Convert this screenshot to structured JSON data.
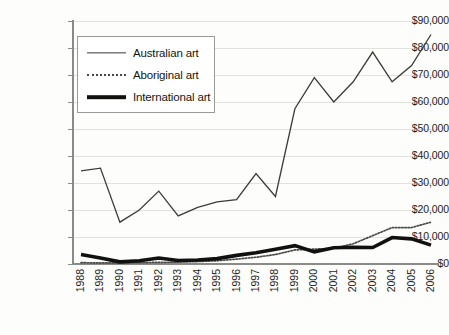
{
  "chart_data": {
    "type": "line",
    "title": "",
    "xlabel": "",
    "ylabel": "",
    "ylim": [
      0,
      90000
    ],
    "ytick_step": 10000,
    "grid": true,
    "legend_position": "top-left-inside",
    "ytick_labels": [
      "$90,000",
      "$80,000",
      "$70,000",
      "$60,000",
      "$50,000",
      "$40,000",
      "$30,000",
      "$20,000",
      "$10,000",
      "$0"
    ],
    "ytick_values": [
      90000,
      80000,
      70000,
      60000,
      50000,
      40000,
      30000,
      20000,
      10000,
      0
    ],
    "categories": [
      "1988",
      "1989",
      "1990",
      "1991",
      "1992",
      "1993",
      "1994",
      "1995",
      "1996",
      "1997",
      "1998",
      "1999",
      "2000",
      "2001",
      "2002",
      "2003",
      "2004",
      "2005",
      "2006"
    ],
    "x": [
      1988,
      1989,
      1990,
      1991,
      1992,
      1993,
      1994,
      1995,
      1996,
      1997,
      1998,
      1999,
      2000,
      2001,
      2002,
      2003,
      2004,
      2005,
      2006
    ],
    "series": [
      {
        "name": "Australian art",
        "style": "solid-thin",
        "color": "#3b3b39",
        "values": [
          34500,
          35500,
          15500,
          20000,
          27000,
          17800,
          21000,
          23000,
          23800,
          33500,
          25000,
          57500,
          69000,
          60000,
          67500,
          78500,
          67500,
          73500,
          85000
        ]
      },
      {
        "name": "Aboriginal art",
        "style": "dotted",
        "color": "#4a4a48",
        "values": [
          500,
          400,
          400,
          500,
          600,
          700,
          900,
          1200,
          1800,
          2500,
          3500,
          5200,
          5500,
          5800,
          7500,
          10500,
          13500,
          13500,
          15500
        ]
      },
      {
        "name": "International art",
        "style": "solid-thick",
        "color": "#111110",
        "values": [
          3500,
          2200,
          800,
          1200,
          2200,
          1300,
          1500,
          2000,
          3200,
          4200,
          5500,
          6800,
          4500,
          6000,
          6200,
          6100,
          9800,
          9300,
          7000
        ]
      }
    ]
  },
  "legend": {
    "items": [
      {
        "label": "Australian art"
      },
      {
        "label": "Aboriginal art"
      },
      {
        "label": "International art"
      }
    ]
  }
}
